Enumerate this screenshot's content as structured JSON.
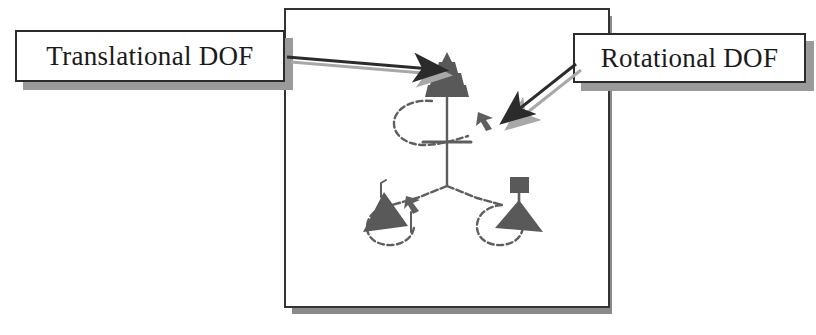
{
  "figure": {
    "type": "mechanism-dof-diagram",
    "background_color": "#ffffff",
    "frame": {
      "name": "figure-frame",
      "border_color": "#333333",
      "shadow_color": "#8a8a8a",
      "x": 284,
      "y": 8,
      "width": 326,
      "height": 300
    },
    "ink_color": "#5e5e5e",
    "dark_fill_color": "#595959",
    "line_color": "#2b2b2b"
  },
  "callouts": [
    {
      "id": "translational",
      "label": "Translational DOF",
      "box": {
        "x": 15,
        "y": 30,
        "width": 270,
        "height": 52
      },
      "shadow_offset": 8,
      "arrow": {
        "name": "translational-pointer-arrow",
        "from": [
          285,
          58
        ],
        "to": [
          441,
          71
        ],
        "direction": "right",
        "points_at": "top-cone-joint"
      }
    },
    {
      "id": "rotational",
      "label": "Rotational DOF",
      "box": {
        "x": 573,
        "y": 33,
        "width": 233,
        "height": 50
      },
      "shadow_offset": 8,
      "arrow": {
        "name": "rotational-pointer-arrow",
        "from": [
          575,
          64
        ],
        "to": [
          503,
          121
        ],
        "direction": "down-left",
        "points_at": "upper-rotation-arrowhead"
      }
    }
  ],
  "mechanism": {
    "top_joint": {
      "name": "top-translational-cone",
      "shape": "stepped-cone",
      "center_x": 447,
      "apex_y": 54,
      "base_y": 97
    },
    "central_stem": {
      "x": 447,
      "from_y": 97,
      "to_y": 185
    },
    "crossbar": {
      "y": 142,
      "from_x": 424,
      "to_x": 470
    },
    "branches": [
      {
        "name": "left-branch",
        "from": [
          447,
          185
        ],
        "to": [
          392,
          205
        ]
      },
      {
        "name": "right-branch",
        "from": [
          447,
          185
        ],
        "to": [
          502,
          205
        ]
      }
    ],
    "legs": [
      {
        "name": "left-leg",
        "triangle_fill": "#595959",
        "marker": "thin-stem",
        "loop_arrow": true
      },
      {
        "name": "right-leg",
        "triangle_fill": "#595959",
        "marker": "square-block",
        "loop_arrow": true
      }
    ],
    "rotation_loops": [
      {
        "name": "top-rotation-loop",
        "center": [
          424,
          122
        ],
        "arrowhead_at": [
          487,
          118
        ]
      },
      {
        "name": "left-leg-rotation-loop",
        "center": [
          399,
          220
        ],
        "arrowhead_at": [
          418,
          205
        ]
      },
      {
        "name": "right-leg-rotation-loop",
        "center": [
          488,
          222
        ],
        "arrowhead_at": [
          498,
          207
        ]
      }
    ]
  }
}
